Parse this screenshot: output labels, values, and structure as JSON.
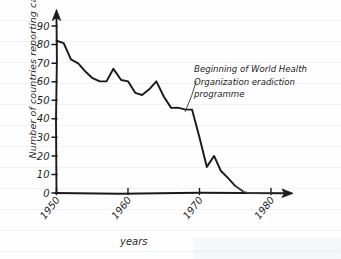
{
  "chart_data": {
    "type": "line",
    "title": "",
    "xlabel": "years",
    "ylabel": "Number of countries reporting cases",
    "xlim": [
      1950,
      1981
    ],
    "ylim": [
      0,
      95
    ],
    "grid": false,
    "legend": "none",
    "x_tick_labels": [
      "1950",
      "1960",
      "1970",
      "1980"
    ],
    "x_ticks": [
      1950,
      1960,
      1970,
      1980
    ],
    "y_tick_labels": [
      "0",
      "10",
      "20",
      "30",
      "40",
      "50",
      "60",
      "70",
      "80",
      "90"
    ],
    "y_ticks": [
      0,
      10,
      20,
      30,
      40,
      50,
      60,
      70,
      80,
      90
    ],
    "series": [
      {
        "name": "Number of countries reporting cases",
        "x": [
          1950,
          1951,
          1952,
          1953,
          1954,
          1955,
          1956,
          1957,
          1958,
          1959,
          1960,
          1961,
          1962,
          1963,
          1964,
          1965,
          1966,
          1967,
          1968,
          1969,
          1970,
          1971,
          1972,
          1973,
          1974,
          1975,
          1976,
          1977,
          1978,
          1979,
          1980
        ],
        "values": [
          82,
          81,
          72,
          70,
          66,
          62,
          60,
          60,
          67,
          61,
          60,
          54,
          53,
          56,
          60,
          52,
          46,
          46,
          45,
          45,
          30,
          14,
          20,
          12,
          8,
          4,
          1,
          0,
          0,
          0,
          0
        ]
      }
    ],
    "annotations": [
      {
        "text": "Beginning of World Health Organization eradiction programme",
        "lines": [
          "Beginning of World Health",
          "Organization eradiction",
          "programme"
        ],
        "points_to_x": 1968,
        "points_to_y": 45
      }
    ]
  },
  "axes": {
    "y_axis_name": "y-axis",
    "x_axis_name": "x-axis"
  }
}
